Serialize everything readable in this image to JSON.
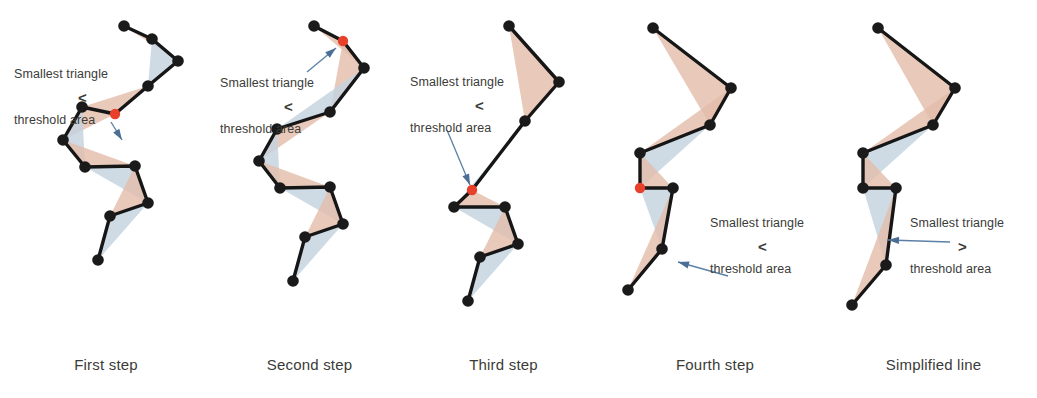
{
  "figure": {
    "background": "#ffffff",
    "colors": {
      "vertex": "#1a1a1a",
      "removed_vertex": "#e8402a",
      "line": "#161616",
      "triangle_warm": "#e3bdab",
      "triangle_cool": "#c3d3df",
      "arrow": "#5b7fa6",
      "text": "#3b3b38"
    }
  },
  "annotations": {
    "smallest_triangle": "Smallest triangle",
    "threshold_area": "threshold area",
    "less_than": "<",
    "greater_than": ">"
  },
  "panels": [
    {
      "id": "first-step",
      "caption": "First step",
      "x": 0,
      "width": 212,
      "comparison": "<",
      "label_top": "Smallest triangle",
      "label_bottom": "threshold area",
      "label_x": 14,
      "label_top_y": 67,
      "cmp_x": 78,
      "cmp_y": 89,
      "label_bottom_y": 113,
      "marked_vertex_index": 4,
      "points": [
        [
          124,
          26
        ],
        [
          152,
          39
        ],
        [
          178,
          61
        ],
        [
          148,
          86
        ],
        [
          115,
          114
        ],
        [
          82,
          107
        ],
        [
          63,
          140
        ],
        [
          85,
          167
        ],
        [
          135,
          166
        ],
        [
          148,
          203
        ],
        [
          110,
          216
        ],
        [
          98,
          260
        ]
      ],
      "arrow": {
        "x1": 111,
        "y1": 122,
        "x2": 122,
        "y2": 140
      },
      "triangles": [
        {
          "pts": "124,26 152,39 178,61",
          "tone": "warm"
        },
        {
          "pts": "152,39 178,61 148,86",
          "tone": "cool"
        },
        {
          "pts": "178,61 148,86 115,114",
          "tone": "warm"
        },
        {
          "pts": "148,86 115,114 82,107",
          "tone": "warm"
        },
        {
          "pts": "115,114 82,107 63,140",
          "tone": "warm"
        },
        {
          "pts": "82,107 63,140 85,167",
          "tone": "cool"
        },
        {
          "pts": "63,140 85,167 135,166",
          "tone": "warm"
        },
        {
          "pts": "85,167 135,166 148,203",
          "tone": "cool"
        },
        {
          "pts": "135,166 148,203 110,216",
          "tone": "warm"
        },
        {
          "pts": "148,203 110,216 98,260",
          "tone": "cool"
        }
      ]
    },
    {
      "id": "second-step",
      "caption": "Second step",
      "x": 212,
      "width": 195,
      "comparison": "<",
      "label_top": "Smallest triangle",
      "label_bottom": "threshold area",
      "label_x": 8,
      "label_top_y": 76,
      "cmp_x": 72,
      "cmp_y": 98,
      "label_bottom_y": 122,
      "marked_vertex_index": 1,
      "points": [
        [
          102,
          26
        ],
        [
          131,
          41
        ],
        [
          152,
          68
        ],
        [
          118,
          112
        ],
        [
          65,
          129
        ],
        [
          47,
          161
        ],
        [
          68,
          188
        ],
        [
          118,
          187
        ],
        [
          131,
          224
        ],
        [
          93,
          237
        ],
        [
          81,
          281
        ]
      ],
      "arrow": {
        "x1": 95,
        "y1": 72,
        "x2": 124,
        "y2": 48
      },
      "triangles": [
        {
          "pts": "102,26 131,41 152,68",
          "tone": "warm"
        },
        {
          "pts": "131,41 152,68 118,112",
          "tone": "warm"
        },
        {
          "pts": "152,68 118,112 65,129",
          "tone": "cool"
        },
        {
          "pts": "118,112 65,129 47,161",
          "tone": "warm"
        },
        {
          "pts": "65,129 47,161 68,188",
          "tone": "cool"
        },
        {
          "pts": "47,161 68,188 118,187",
          "tone": "warm"
        },
        {
          "pts": "68,188 118,187 131,224",
          "tone": "cool"
        },
        {
          "pts": "118,187 131,224 93,237",
          "tone": "warm"
        },
        {
          "pts": "131,224 93,237 81,281",
          "tone": "cool"
        }
      ]
    },
    {
      "id": "third-step",
      "caption": "Third step",
      "x": 407,
      "width": 193,
      "comparison": "<",
      "label_top": "Smallest triangle",
      "label_bottom": "threshold area",
      "label_x": 3,
      "label_top_y": 75,
      "cmp_x": 68,
      "cmp_y": 97,
      "label_bottom_y": 121,
      "marked_vertex_index": 3,
      "points": [
        [
          102,
          26
        ],
        [
          152,
          82
        ],
        [
          118,
          121
        ],
        [
          65,
          190
        ],
        [
          47,
          207
        ],
        [
          98,
          207
        ],
        [
          111,
          244
        ],
        [
          73,
          257
        ],
        [
          61,
          301
        ]
      ],
      "arrow": {
        "x1": 40,
        "y1": 130,
        "x2": 63,
        "y2": 185
      },
      "triangles": [
        {
          "pts": "102,26 152,82 118,121",
          "tone": "warm"
        },
        {
          "pts": "152,82 118,121 65,190",
          "tone": "warm"
        },
        {
          "pts": "118,121 65,190 47,207",
          "tone": "cool"
        },
        {
          "pts": "65,190 47,207 98,207",
          "tone": "warm"
        },
        {
          "pts": "47,207 98,207 111,244",
          "tone": "cool"
        },
        {
          "pts": "98,207 111,244 73,257",
          "tone": "warm"
        },
        {
          "pts": "111,244 73,257 61,301",
          "tone": "cool"
        }
      ]
    },
    {
      "id": "fourth-step",
      "caption": "Fourth step",
      "x": 600,
      "width": 230,
      "comparison": "<",
      "label_top": "Smallest triangle",
      "label_bottom": "threshold area",
      "label_x": 110,
      "label_top_y": 216,
      "cmp_x": 158,
      "cmp_y": 238,
      "label_bottom_y": 262,
      "marked_vertex_index": 4,
      "points": [
        [
          53,
          28
        ],
        [
          131,
          88
        ],
        [
          110,
          125
        ],
        [
          40,
          153
        ],
        [
          40,
          188
        ],
        [
          73,
          188
        ],
        [
          62,
          249
        ],
        [
          28,
          290
        ]
      ],
      "arrow": {
        "x1": 128,
        "y1": 276,
        "x2": 78,
        "y2": 262
      },
      "triangles": [
        {
          "pts": "53,28 131,88 110,125",
          "tone": "warm"
        },
        {
          "pts": "131,88 110,125 40,153",
          "tone": "warm"
        },
        {
          "pts": "110,125 40,153 40,188",
          "tone": "cool"
        },
        {
          "pts": "40,153 40,188 73,188",
          "tone": "warm"
        },
        {
          "pts": "40,188 73,188 62,249",
          "tone": "cool"
        },
        {
          "pts": "73,188 62,249 28,290",
          "tone": "warm"
        }
      ]
    },
    {
      "id": "simplified-line",
      "caption": "Simplified line",
      "x": 830,
      "width": 207,
      "comparison": ">",
      "label_top": "Smallest triangle",
      "label_bottom": "threshold area",
      "label_x": 80,
      "label_top_y": 216,
      "cmp_x": 128,
      "cmp_y": 238,
      "label_bottom_y": 262,
      "marked_vertex_index": null,
      "points": [
        [
          48,
          28
        ],
        [
          125,
          88
        ],
        [
          103,
          125
        ],
        [
          33,
          153
        ],
        [
          33,
          188
        ],
        [
          66,
          188
        ],
        [
          56,
          265
        ],
        [
          22,
          305
        ]
      ],
      "arrow": {
        "x1": 120,
        "y1": 242,
        "x2": 58,
        "y2": 240
      },
      "triangles": [
        {
          "pts": "48,28 125,88 103,125",
          "tone": "warm"
        },
        {
          "pts": "125,88 103,125 33,153",
          "tone": "warm"
        },
        {
          "pts": "103,125 33,153 33,188",
          "tone": "cool"
        },
        {
          "pts": "33,153 33,188 66,188",
          "tone": "warm"
        },
        {
          "pts": "33,188 66,188 56,265",
          "tone": "cool"
        },
        {
          "pts": "66,188 56,265 22,305",
          "tone": "warm"
        }
      ]
    }
  ]
}
